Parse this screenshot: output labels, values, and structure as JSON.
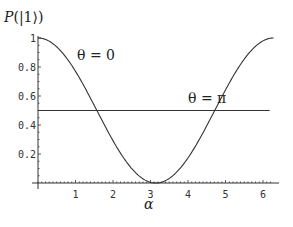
{
  "chart_data": {
    "type": "line",
    "title": "",
    "ylabel": "P(|1⟩)",
    "xlabel": "α",
    "xlim": [
      0,
      6.2832
    ],
    "ylim": [
      0,
      1
    ],
    "grid": false,
    "legend": "none (inline annotations)",
    "x_ticks": [
      "1",
      "2",
      "3",
      "4",
      "5",
      "6"
    ],
    "y_ticks": [
      "0.2",
      "0.4",
      "0.6",
      "0.8",
      "1"
    ],
    "series": [
      {
        "name": "θ = 0",
        "formula": "cos^2(α/2)",
        "x": [
          0,
          0.5,
          1,
          1.5,
          2,
          2.5,
          3,
          3.1416,
          3.5,
          4,
          4.5,
          5,
          5.5,
          6,
          6.2832
        ],
        "values": [
          1.0,
          0.94,
          0.77,
          0.54,
          0.29,
          0.1,
          0.005,
          0.0,
          0.03,
          0.18,
          0.39,
          0.64,
          0.85,
          0.98,
          1.0
        ]
      },
      {
        "name": "θ = π",
        "formula": "0.5",
        "x": [
          0,
          6.2832
        ],
        "values": [
          0.5,
          0.5
        ]
      }
    ],
    "annotations": [
      {
        "text": "θ = 0",
        "x": 1.5,
        "y": 0.85
      },
      {
        "text": "θ = π",
        "x": 4.3,
        "y": 0.57
      }
    ]
  },
  "labels": {
    "ylabel": "P(|1⟩)",
    "xlabel": "α",
    "annot_theta0": "θ = 0",
    "annot_thetapi": "θ = π"
  }
}
